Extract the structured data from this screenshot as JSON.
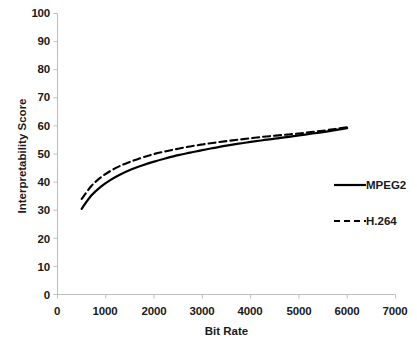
{
  "chart_data": {
    "type": "line",
    "title": "",
    "xlabel": "Bit Rate",
    "ylabel": "Interpretability Score",
    "xlim": [
      0,
      7000
    ],
    "ylim": [
      0,
      100
    ],
    "xticks": [
      0,
      1000,
      2000,
      3000,
      4000,
      5000,
      6000,
      7000
    ],
    "yticks": [
      0,
      10,
      20,
      30,
      40,
      50,
      60,
      70,
      80,
      90,
      100
    ],
    "grid": false,
    "legend_position": "center-right",
    "series": [
      {
        "name": "MPEG2",
        "style": "solid",
        "color": "#000000",
        "x": [
          500,
          700,
          900,
          1100,
          1300,
          1500,
          1750,
          2000,
          2250,
          2500,
          2750,
          3000,
          3250,
          3500,
          3750,
          4000,
          4250,
          4500,
          4750,
          5000,
          5250,
          5500,
          5750,
          6000
        ],
        "y": [
          30.5,
          35.2,
          38.4,
          40.8,
          42.7,
          44.3,
          45.9,
          47.3,
          48.5,
          49.6,
          50.5,
          51.4,
          52.2,
          53.0,
          53.7,
          54.3,
          54.9,
          55.5,
          56.0,
          56.6,
          57.2,
          57.8,
          58.5,
          59.2
        ]
      },
      {
        "name": "H.264",
        "style": "dashed",
        "color": "#000000",
        "x": [
          500,
          700,
          900,
          1100,
          1300,
          1500,
          1750,
          2000,
          2250,
          2500,
          2750,
          3000,
          3250,
          3500,
          3750,
          4000,
          4250,
          4500,
          4750,
          5000,
          5250,
          5500,
          5750,
          6000
        ],
        "y": [
          34.0,
          38.6,
          41.7,
          44.0,
          45.8,
          47.2,
          48.7,
          50.0,
          51.0,
          51.9,
          52.7,
          53.4,
          54.0,
          54.6,
          55.1,
          55.6,
          56.1,
          56.5,
          56.9,
          57.3,
          57.8,
          58.3,
          58.9,
          59.5
        ]
      }
    ]
  },
  "axes": {
    "x_title": "Bit Rate",
    "y_title": "Interpretability Score",
    "x_tick_labels": [
      "0",
      "1000",
      "2000",
      "3000",
      "4000",
      "5000",
      "6000",
      "7000"
    ],
    "y_tick_labels": [
      "100",
      "90",
      "80",
      "70",
      "60",
      "50",
      "40",
      "30",
      "20",
      "10",
      "0"
    ],
    "axis_color": "#bfbfbf"
  },
  "legend": {
    "entries": [
      {
        "label": "MPEG2",
        "style": "solid"
      },
      {
        "label": "H.264",
        "style": "dashed"
      }
    ]
  }
}
